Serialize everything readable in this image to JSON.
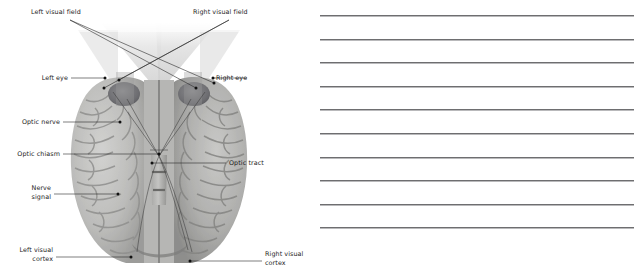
{
  "page": {
    "width": 636,
    "height": 271,
    "background": "#ffffff"
  },
  "diagram": {
    "title_alt": "Visual pathway from eyes to visual cortex, inferior view of brain",
    "colors": {
      "label_text": "#1c1c1c",
      "leader_line": "#2a2a2a",
      "ray_line": "#3a3a3a",
      "brain_light": "#c8c8c6",
      "brain_mid": "#a9a9a7",
      "brain_dark": "#8d8d8b",
      "eye_dark": "#6f6f72",
      "field_wedge": "#d9d9d9"
    },
    "labels": [
      {
        "id": "left-visual-field",
        "text": "Left visual field",
        "line1": "Left visual field",
        "line2": ""
      },
      {
        "id": "right-visual-field",
        "text": "Right visual field",
        "line1": "Right visual field",
        "line2": ""
      },
      {
        "id": "left-eye",
        "text": "Left eye",
        "line1": "Left eye",
        "line2": ""
      },
      {
        "id": "right-eye",
        "text": "Right eye",
        "line1": "Right eye",
        "line2": ""
      },
      {
        "id": "optic-nerve",
        "text": "Optic nerve",
        "line1": "Optic nerve",
        "line2": ""
      },
      {
        "id": "optic-chiasm",
        "text": "Optic chiasm",
        "line1": "Optic chiasm",
        "line2": ""
      },
      {
        "id": "optic-tract",
        "text": "Optic tract",
        "line1": "Optic tract",
        "line2": ""
      },
      {
        "id": "nerve-signal",
        "text": "Nerve signal",
        "line1": "Nerve",
        "line2": "signal"
      },
      {
        "id": "left-visual-cortex",
        "text": "Left visual cortex",
        "line1": "Left visual",
        "line2": "cortex"
      },
      {
        "id": "right-visual-cortex",
        "text": "Right visual cortex",
        "line1": "Right visual",
        "line2": "cortex"
      }
    ],
    "text": {
      "left_visual_field": "Left visual field",
      "right_visual_field": "Right visual field",
      "left_eye": "Left eye",
      "right_eye": "Right eye",
      "optic_nerve": "Optic nerve",
      "optic_chiasm": "Optic chiasm",
      "optic_tract": "Optic tract",
      "nerve_signal_1": "Nerve",
      "nerve_signal_2": "signal",
      "left_visual_cortex_1": "Left visual",
      "left_visual_cortex_2": "cortex",
      "right_visual_cortex_1": "Right visual",
      "right_visual_cortex_2": "cortex"
    }
  },
  "notes": {
    "line_count": 10,
    "first_line_y": 15,
    "line_spacing": 23.6,
    "line_color": "#6e6e70",
    "left": 2,
    "width": 314
  }
}
